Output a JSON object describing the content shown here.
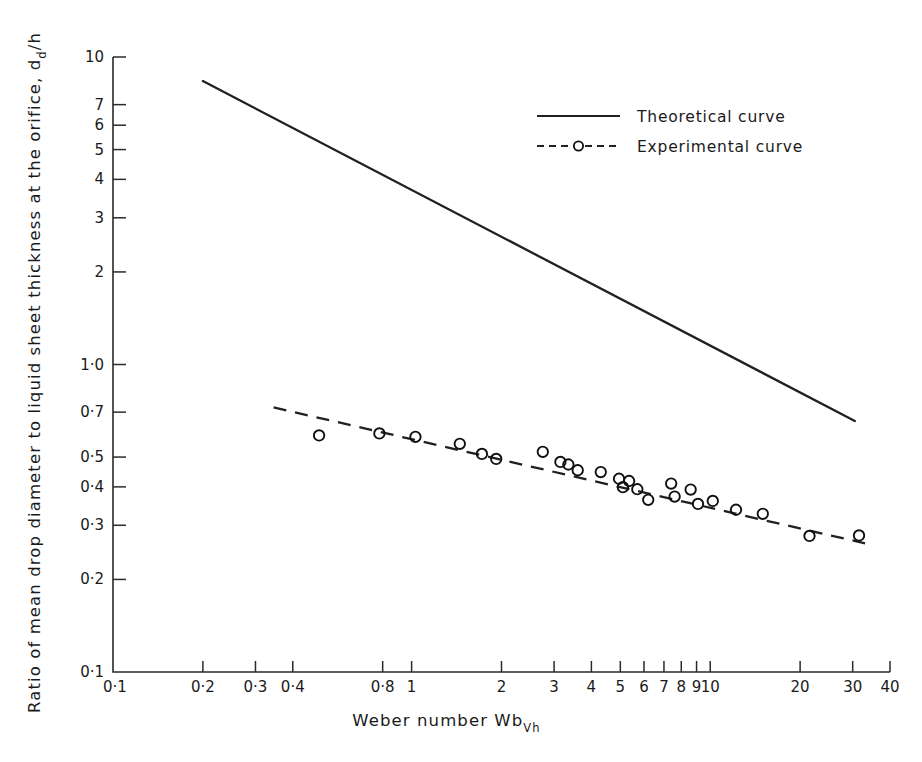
{
  "chart_data": {
    "type": "scatter",
    "title": "",
    "xlabel": "Weber number  Wb",
    "xlabel_sub": "Vh",
    "ylabel": "Ratio of mean drop diameter to liquid sheet thickness at the orifice, d",
    "ylabel_sub": "d",
    "ylabel_tail": "/h",
    "xscale": "log",
    "yscale": "log",
    "xlim": [
      0.1,
      40
    ],
    "ylim": [
      0.1,
      10
    ],
    "grid": false,
    "legend_position": "upper-right",
    "xticks": [
      {
        "value": 0.1,
        "label": "0·1"
      },
      {
        "value": 0.2,
        "label": "0·2"
      },
      {
        "value": 0.3,
        "label": "0·3"
      },
      {
        "value": 0.4,
        "label": "0·4"
      },
      {
        "value": 0.8,
        "label": "0·8"
      },
      {
        "value": 1,
        "label": "1"
      },
      {
        "value": 2,
        "label": "2"
      },
      {
        "value": 3,
        "label": "3"
      },
      {
        "value": 4,
        "label": "4"
      },
      {
        "value": 5,
        "label": "5"
      },
      {
        "value": 6,
        "label": "6"
      },
      {
        "value": 7,
        "label": "7"
      },
      {
        "value": 8,
        "label": "8"
      },
      {
        "value": 9,
        "label": "9"
      },
      {
        "value": 10,
        "label": "10"
      },
      {
        "value": 20,
        "label": "20"
      },
      {
        "value": 30,
        "label": "30"
      },
      {
        "value": 40,
        "label": "40"
      }
    ],
    "yticks": [
      {
        "value": 0.1,
        "label": "0·1"
      },
      {
        "value": 0.2,
        "label": "0·2"
      },
      {
        "value": 0.3,
        "label": "0·3"
      },
      {
        "value": 0.4,
        "label": "0·4"
      },
      {
        "value": 0.5,
        "label": "0·5"
      },
      {
        "value": 0.7,
        "label": "0·7"
      },
      {
        "value": 1.0,
        "label": "1·0"
      },
      {
        "value": 2,
        "label": "2"
      },
      {
        "value": 3,
        "label": "3"
      },
      {
        "value": 4,
        "label": "4"
      },
      {
        "value": 5,
        "label": "5"
      },
      {
        "value": 6,
        "label": "6"
      },
      {
        "value": 7,
        "label": "7"
      },
      {
        "value": 10,
        "label": "10"
      }
    ],
    "series": [
      {
        "name": "Theoretical curve",
        "style": "solid-line",
        "x": [
          0.2,
          30.5
        ],
        "y": [
          8.35,
          0.655
        ]
      },
      {
        "name": "Experimental curve",
        "style": "dashed-line-with-open-circles",
        "line_x": [
          0.345,
          33.0
        ],
        "line_y": [
          0.725,
          0.262
        ],
        "points_x": [
          0.49,
          0.78,
          1.03,
          1.45,
          1.72,
          1.92,
          2.75,
          3.15,
          3.35,
          3.6,
          4.3,
          4.95,
          5.1,
          5.35,
          5.7,
          6.2,
          7.4,
          7.6,
          8.6,
          9.1,
          10.2,
          12.2,
          15.0,
          21.5,
          31.5
        ],
        "points_y": [
          0.588,
          0.597,
          0.582,
          0.552,
          0.512,
          0.493,
          0.52,
          0.482,
          0.473,
          0.453,
          0.447,
          0.425,
          0.399,
          0.418,
          0.393,
          0.363,
          0.41,
          0.372,
          0.392,
          0.352,
          0.36,
          0.337,
          0.327,
          0.277,
          0.278
        ]
      }
    ],
    "legend": [
      {
        "label": "Theoretical curve",
        "style": "solid"
      },
      {
        "label": "Experimental curve",
        "style": "dashed-marker"
      }
    ]
  }
}
